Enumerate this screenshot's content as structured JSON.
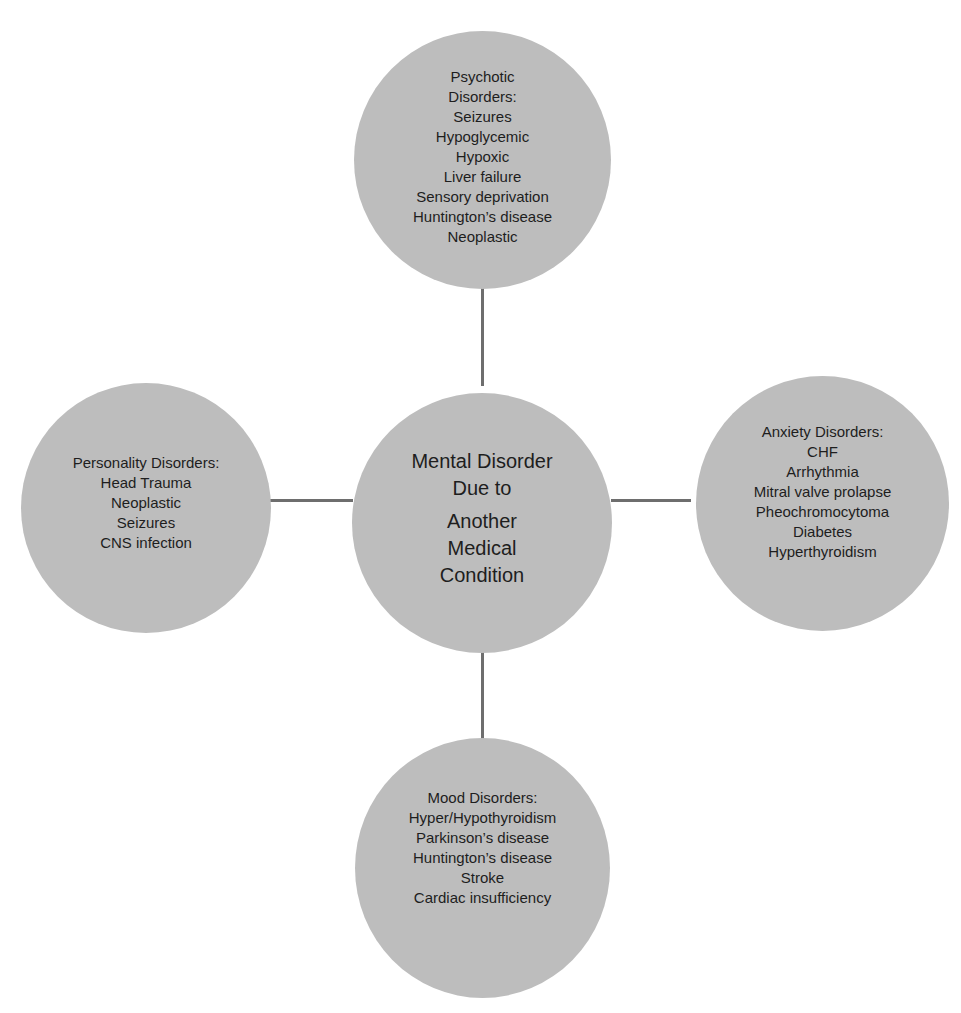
{
  "diagram": {
    "type": "hub-and-spoke",
    "fill_color": "#bdbdbd",
    "connector_color": "#6e6e6e",
    "center": {
      "title_line1": "Mental Disorder",
      "title_line2": "Due to",
      "title_line3": "Another",
      "title_line4": "Medical",
      "title_line5": "Condition"
    },
    "nodes": {
      "top": {
        "title_line1": "Psychotic",
        "title_line2": "Disorders:",
        "items": [
          "Seizures",
          "Hypoglycemic",
          "Hypoxic",
          "Liver failure",
          "Sensory deprivation",
          "Huntington’s disease",
          "Neoplastic"
        ]
      },
      "left": {
        "title": "Personality Disorders:",
        "items": [
          "Head Trauma",
          "Neoplastic",
          "Seizures",
          "CNS infection"
        ]
      },
      "right": {
        "title": "Anxiety Disorders:",
        "items": [
          "CHF",
          "Arrhythmia",
          "Mitral valve prolapse",
          "Pheochromocytoma",
          "Diabetes",
          "Hyperthyroidism"
        ]
      },
      "bottom": {
        "title": "Mood Disorders:",
        "items": [
          "Hyper/Hypothyroidism",
          "Parkinson’s disease",
          "Huntington’s disease",
          "Stroke",
          "Cardiac insufficiency"
        ]
      }
    }
  }
}
